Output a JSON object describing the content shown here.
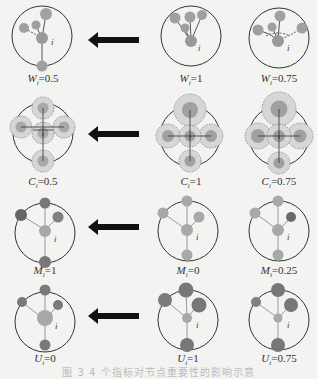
{
  "colors": {
    "background": "#f3f3f1",
    "outline": "#333333",
    "node_light": "#a8a8a8",
    "node_mid": "#8f8f8f",
    "node_dark": "#6a6a6a",
    "halo": "#d4d4d4",
    "arrow": "#111111"
  },
  "center_node_label": "i",
  "arrow_icon": "left-arrow-icon",
  "rows": [
    {
      "metric": "W",
      "panels": [
        {
          "symbol": "W",
          "subscript": "i",
          "value": "=0.5"
        },
        {
          "symbol": "W",
          "subscript": "i",
          "value": "=1"
        },
        {
          "symbol": "W",
          "subscript": "i",
          "value": "=0.75"
        }
      ]
    },
    {
      "metric": "C",
      "panels": [
        {
          "symbol": "C",
          "subscript": "i",
          "value": "=0.5"
        },
        {
          "symbol": "C",
          "subscript": "i",
          "value": "=1"
        },
        {
          "symbol": "C",
          "subscript": "i",
          "value": "=0.75"
        }
      ]
    },
    {
      "metric": "M",
      "panels": [
        {
          "symbol": "M",
          "subscript": "i",
          "value": "=1"
        },
        {
          "symbol": "M",
          "subscript": "i",
          "value": "=0"
        },
        {
          "symbol": "M",
          "subscript": "i",
          "value": "=0.25"
        }
      ]
    },
    {
      "metric": "U",
      "panels": [
        {
          "symbol": "U",
          "subscript": "i",
          "value": "=0"
        },
        {
          "symbol": "U",
          "subscript": "i",
          "value": "=1"
        },
        {
          "symbol": "U",
          "subscript": "i",
          "value": "=0.75"
        }
      ]
    }
  ],
  "caption": "图 3  4 个指标对节点重要性的影响示意"
}
